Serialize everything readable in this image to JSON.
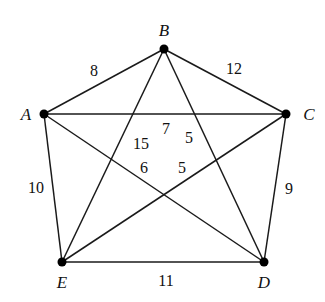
{
  "diagram": {
    "type": "weighted-complete-graph",
    "colors": {
      "edge": "#1a1a1a",
      "node": "#000000",
      "text": "#111111",
      "background": "#ffffff"
    },
    "nodes": [
      {
        "id": "A",
        "label": "A",
        "x": 44,
        "y": 114,
        "lx": 26,
        "ly": 120
      },
      {
        "id": "B",
        "label": "B",
        "x": 164,
        "y": 49,
        "lx": 164,
        "ly": 36
      },
      {
        "id": "C",
        "label": "C",
        "x": 286,
        "y": 114,
        "lx": 309,
        "ly": 120
      },
      {
        "id": "D",
        "label": "D",
        "x": 264,
        "y": 262,
        "lx": 264,
        "ly": 288
      },
      {
        "id": "E",
        "label": "E",
        "x": 62,
        "y": 262,
        "lx": 62,
        "ly": 288
      }
    ],
    "edges": [
      {
        "from": "A",
        "to": "B",
        "weight": "8",
        "lx": 94,
        "ly": 76
      },
      {
        "from": "B",
        "to": "C",
        "weight": "12",
        "lx": 234,
        "ly": 74
      },
      {
        "from": "A",
        "to": "C",
        "weight": "7",
        "lx": 166,
        "ly": 134
      },
      {
        "from": "B",
        "to": "E",
        "weight": "15",
        "lx": 141,
        "ly": 149
      },
      {
        "from": "B",
        "to": "D",
        "weight": "5",
        "lx": 189,
        "ly": 143
      },
      {
        "from": "A",
        "to": "D",
        "weight": "6",
        "lx": 144,
        "ly": 173
      },
      {
        "from": "C",
        "to": "E",
        "weight": "5",
        "lx": 182,
        "ly": 173
      },
      {
        "from": "A",
        "to": "E",
        "weight": "10",
        "lx": 36,
        "ly": 193
      },
      {
        "from": "C",
        "to": "D",
        "weight": "9",
        "lx": 289,
        "ly": 194
      },
      {
        "from": "E",
        "to": "D",
        "weight": "11",
        "lx": 166,
        "ly": 286
      }
    ]
  }
}
